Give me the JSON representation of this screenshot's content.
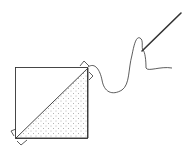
{
  "diagram": {
    "elements": [
      {
        "name": "fabric-square",
        "fill": "#ffffff"
      },
      {
        "name": "dotted-triangle",
        "fill": "dotted"
      },
      {
        "name": "thread"
      },
      {
        "name": "needle"
      }
    ],
    "colors": {
      "stroke": "#333333",
      "background": "#ffffff",
      "dots": "#666666"
    }
  }
}
